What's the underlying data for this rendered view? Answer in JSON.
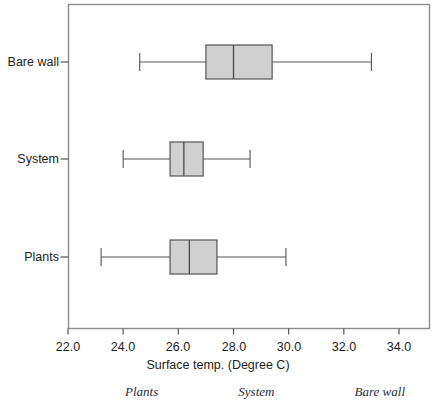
{
  "chart_data": {
    "type": "box",
    "orientation": "horizontal",
    "title": "",
    "xlabel": "Surface temp. (Degree C)",
    "ylabel": "",
    "xlim": [
      21.2,
      35.0
    ],
    "xticks": [
      "22.0",
      "24.0",
      "26.0",
      "28.0",
      "30.0",
      "32.0",
      "34.0"
    ],
    "xtick_values": [
      22.0,
      24.0,
      26.0,
      28.0,
      30.0,
      32.0,
      34.0
    ],
    "categories": [
      "Bare wall",
      "System",
      "Plants"
    ],
    "grid": false,
    "legend": "none",
    "boxes": [
      {
        "category": "Bare wall",
        "whisker_low": 24.6,
        "q1": 27.0,
        "median": 28.0,
        "q3": 29.4,
        "whisker_high": 33.0
      },
      {
        "category": "System",
        "whisker_low": 24.0,
        "q1": 25.7,
        "median": 26.2,
        "q3": 26.9,
        "whisker_high": 28.6
      },
      {
        "category": "Plants",
        "whisker_low": 23.2,
        "q1": 25.7,
        "median": 26.4,
        "q3": 27.4,
        "whisker_high": 29.9
      }
    ],
    "box_fill": "#d0d0d0",
    "box_stroke": "#555555",
    "axis_color": "#888888"
  },
  "axis": {
    "x_title": "Surface temp. (Degree C)",
    "tick_labels": [
      "22.0",
      "24.0",
      "26.0",
      "28.0",
      "30.0",
      "32.0",
      "34.0"
    ],
    "category_labels": [
      "Bare wall",
      "System",
      "Plants"
    ]
  },
  "caption": {
    "items": [
      "Plants",
      "System",
      "Bare wall"
    ]
  }
}
